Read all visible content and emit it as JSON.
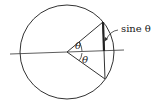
{
  "figure": {
    "labels": {
      "sine": "sine θ",
      "theta_upper": "θ",
      "theta_lower": "θ"
    },
    "colors": {
      "stroke": "#333333",
      "background": "#ffffff"
    }
  }
}
